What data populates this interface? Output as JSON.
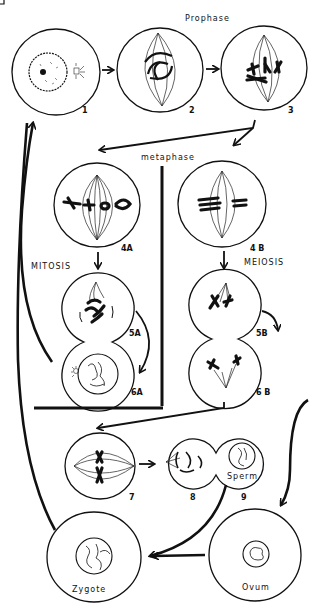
{
  "labels": {
    "prophase": "Prophase",
    "metaphase": "metaphase",
    "mitosis": "MITOSIS",
    "meiosis": "MEIOSIS",
    "sperm": "Sperm",
    "ovum": "Ovum",
    "zygote": "Zygote"
  },
  "stage_numbers": {
    "s1": "1",
    "s2": "2",
    "s3": "3",
    "s4a": "4A",
    "s4b": "4 B",
    "s5a": "5A",
    "s5b": "5B",
    "s6a": "6A",
    "s6b": "6 B",
    "s7": "7",
    "s8": "8",
    "s9": "9"
  },
  "colors": {
    "ink": "#111111",
    "background": "#ffffff"
  }
}
